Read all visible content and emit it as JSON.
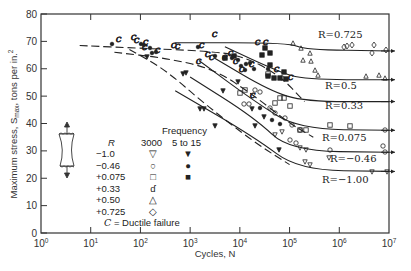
{
  "chart_data": {
    "type": "line",
    "title": "",
    "xlabel": "Cycles, N",
    "ylabel": "Maximum stress, Smax, tons per in.²",
    "ylabel_parts": {
      "main": "Maximum stress, S",
      "sub": "max",
      "tail": ", tons per in.",
      "sup": "2"
    },
    "xscale": "log",
    "xlim": [
      1,
      10000000
    ],
    "ylim": [
      0,
      80
    ],
    "x_ticks": [
      {
        "base": "10",
        "exp": "0"
      },
      {
        "base": "10",
        "exp": "1"
      },
      {
        "base": "10",
        "exp": "2"
      },
      {
        "base": "10",
        "exp": "3"
      },
      {
        "base": "10",
        "exp": "4"
      },
      {
        "base": "10",
        "exp": "5"
      },
      {
        "base": "10",
        "exp": "6"
      },
      {
        "base": "10",
        "exp": "7"
      }
    ],
    "y_ticks": [
      "0",
      "10",
      "20",
      "30",
      "40",
      "50",
      "60",
      "70",
      "80"
    ],
    "grid": false,
    "series": [
      {
        "name": "R=0.725",
        "label": "R=0.725",
        "style": "solid",
        "points": [
          [
            500,
            69.5
          ],
          [
            100000,
            69.5
          ],
          [
            200000,
            67
          ],
          [
            10000000,
            66.5
          ]
        ]
      },
      {
        "name": "R=0.5",
        "label": "R=0.5",
        "style": "solid",
        "points": [
          [
            5000,
            68
          ],
          [
            60000,
            59
          ],
          [
            200000,
            56
          ],
          [
            10000000,
            56
          ]
        ]
      },
      {
        "name": "R=0.33",
        "label": "R=0.33",
        "style": "solid",
        "points": [
          [
            3000,
            64
          ],
          [
            40000,
            52
          ],
          [
            200000,
            48
          ],
          [
            10000000,
            48
          ]
        ]
      },
      {
        "name": "R=0.075",
        "label": "R=0.075",
        "style": "solid",
        "points": [
          [
            1500,
            63
          ],
          [
            20000,
            48
          ],
          [
            150000,
            38
          ],
          [
            10000000,
            37.5
          ]
        ]
      },
      {
        "name": "R=-0.46",
        "label": "R=-0.46",
        "style": "solid",
        "points": [
          [
            1000,
            57
          ],
          [
            20000,
            42
          ],
          [
            100000,
            30
          ],
          [
            10000000,
            29.5
          ]
        ]
      },
      {
        "name": "R=-1.00",
        "label": "R=-1.00",
        "style": "solid",
        "points": [
          [
            500,
            52
          ],
          [
            20000,
            35
          ],
          [
            150000,
            23
          ],
          [
            10000000,
            22.5
          ]
        ]
      },
      {
        "name": "Upper envelope (ductile)",
        "style": "dashed",
        "points": [
          [
            6,
            68.5
          ],
          [
            100,
            67.5
          ],
          [
            2000,
            66.5
          ],
          [
            10000,
            65
          ],
          [
            60000,
            58
          ],
          [
            200000,
            48
          ]
        ]
      },
      {
        "name": "Ductile envelope 2",
        "style": "dashed",
        "points": [
          [
            30,
            66
          ],
          [
            300,
            64
          ],
          [
            3000,
            60
          ],
          [
            20000,
            50
          ],
          [
            100000,
            40
          ],
          [
            300000,
            35
          ]
        ]
      },
      {
        "name": "Low-frequency R=-1",
        "style": "dashed",
        "points": [
          [
            60,
            67
          ],
          [
            300,
            60
          ],
          [
            2000,
            47
          ],
          [
            20000,
            33
          ],
          [
            100000,
            25
          ]
        ]
      }
    ],
    "r_labels": [
      {
        "text": "R=0.725",
        "x": 318,
        "y": 38
      },
      {
        "text": "R=0.5",
        "x": 325,
        "y": 89
      },
      {
        "text": "R=0.33",
        "x": 325,
        "y": 109
      },
      {
        "text": "R=0.075",
        "x": 322,
        "y": 141
      },
      {
        "text": "R=−0.46",
        "x": 330,
        "y": 162
      },
      {
        "text": "R=−1.00",
        "x": 322,
        "y": 183
      }
    ],
    "legend": {
      "header_r": "R",
      "header_freq": "Frequency",
      "col_3000": "3000",
      "col_low": "5 to 15",
      "rows": [
        {
          "r": "−1.0",
          "sym_3000": "▽",
          "sym_low": "▼"
        },
        {
          "r": "−0.46",
          "sym_3000": "○",
          "sym_low": "●"
        },
        {
          "r": "+0.075",
          "sym_3000": "□",
          "sym_low": "■"
        },
        {
          "r": "+0.33",
          "sym_3000": "ɗ",
          "sym_low": ""
        },
        {
          "r": "+0.50",
          "sym_3000": "△",
          "sym_low": ""
        },
        {
          "r": "+0.725",
          "sym_3000": "◇",
          "sym_low": ""
        }
      ],
      "note": "C = Ductile failure"
    },
    "annotations": [
      "C = Ductile failure",
      "specimen sketch with tensile arrows"
    ]
  }
}
